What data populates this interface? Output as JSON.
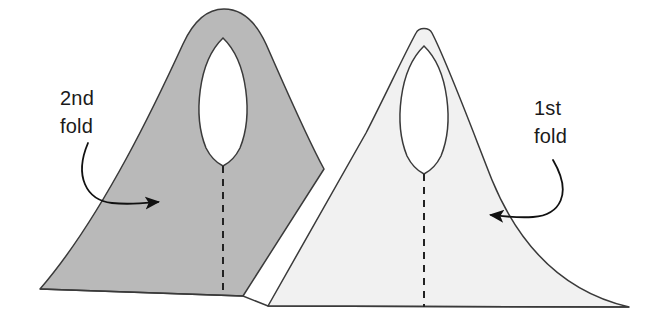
{
  "figure": {
    "background_color": "#ffffff",
    "width": 659,
    "height": 322
  },
  "labels": {
    "second_fold": {
      "line1": "2nd",
      "line2": "fold"
    },
    "first_fold": {
      "line1": "1st",
      "line2": "fold"
    }
  },
  "shapes": {
    "second_fold_sheet": {
      "name": "2nd fold sheet",
      "fill": "#b9b9b9",
      "stroke": "#3a3a3a",
      "hole_fill": "#ffffff"
    },
    "first_fold_sheet": {
      "name": "1st fold sheet",
      "fill": "#f1f1f1",
      "stroke": "#3a3a3a",
      "hole_fill": "#ffffff"
    }
  },
  "annotations": {
    "stroke_color": "#111111",
    "dashed_line_color": "#222222",
    "dash_pattern": "7,6",
    "arrow_second_fold": "curved arrow pointing right into 2nd fold sheet",
    "arrow_first_fold": "curved arrow pointing left into 1st fold sheet",
    "fold_line_second": "vertical dashed center fold line on 2nd fold sheet",
    "fold_line_first": "vertical dashed center fold line on 1st fold sheet",
    "baseline": "horizontal base edge"
  }
}
